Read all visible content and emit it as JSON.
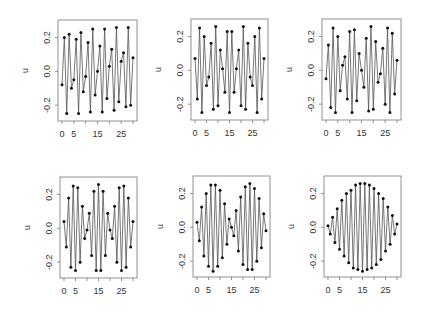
{
  "figure": {
    "layout": "2x3 grid of line plots",
    "background": "#ffffff",
    "line_color": "#555555",
    "point_color": "#111111",
    "axis_color": "#777777"
  },
  "chart_data": [
    {
      "type": "line",
      "title": "",
      "xlabel": "",
      "ylabel": "u",
      "x_ticks": [
        0,
        5,
        15,
        25
      ],
      "y_ticks": [
        "-0.2",
        "0.0",
        "0.2"
      ],
      "ylim": [
        -0.27,
        0.28
      ],
      "xlim": [
        0,
        30
      ],
      "x": [
        0,
        1,
        2,
        3,
        4,
        5,
        6,
        7,
        8,
        9,
        10,
        11,
        12,
        13,
        14,
        15,
        16,
        17,
        18,
        19,
        20,
        21,
        22,
        23,
        24,
        25,
        26,
        27,
        28,
        29,
        30
      ],
      "values": [
        -0.08,
        0.2,
        -0.25,
        0.22,
        -0.1,
        -0.05,
        0.19,
        -0.25,
        0.23,
        -0.12,
        -0.03,
        0.17,
        -0.24,
        0.25,
        -0.14,
        0.0,
        0.15,
        -0.24,
        0.25,
        -0.16,
        0.03,
        0.13,
        -0.23,
        0.26,
        -0.18,
        0.06,
        0.11,
        -0.21,
        0.26,
        -0.2,
        0.08
      ]
    },
    {
      "type": "line",
      "title": "",
      "xlabel": "",
      "ylabel": "u",
      "x_ticks": [
        0,
        5,
        15,
        25
      ],
      "y_ticks": [
        "-0.2",
        "0.0",
        "0.2"
      ],
      "ylim": [
        -0.27,
        0.28
      ],
      "xlim": [
        0,
        30
      ],
      "x": [
        0,
        1,
        2,
        3,
        4,
        5,
        6,
        7,
        8,
        9,
        10,
        11,
        12,
        13,
        14,
        15,
        16,
        17,
        18,
        19,
        20,
        21,
        22,
        23,
        24,
        25,
        26,
        27,
        28,
        29,
        30
      ],
      "values": [
        0.07,
        -0.17,
        0.25,
        -0.25,
        0.2,
        -0.09,
        -0.04,
        0.16,
        -0.23,
        0.26,
        -0.21,
        0.12,
        0.01,
        -0.13,
        0.23,
        -0.25,
        0.23,
        -0.13,
        0.01,
        0.12,
        -0.21,
        0.26,
        -0.23,
        0.16,
        -0.04,
        -0.09,
        0.2,
        -0.25,
        0.25,
        -0.17,
        0.07
      ]
    },
    {
      "type": "line",
      "title": "",
      "xlabel": "",
      "ylabel": "u",
      "x_ticks": [
        0,
        5,
        15,
        25
      ],
      "y_ticks": [
        "-0.2",
        "0.0",
        "0.2"
      ],
      "ylim": [
        -0.27,
        0.28
      ],
      "xlim": [
        0,
        30
      ],
      "x": [
        0,
        1,
        2,
        3,
        4,
        5,
        6,
        7,
        8,
        9,
        10,
        11,
        12,
        13,
        14,
        15,
        16,
        17,
        18,
        19,
        20,
        21,
        22,
        23,
        24,
        25,
        26,
        27,
        28,
        29,
        30
      ],
      "values": [
        -0.05,
        0.15,
        -0.22,
        0.25,
        -0.25,
        0.2,
        -0.12,
        0.03,
        0.08,
        -0.17,
        0.23,
        -0.25,
        0.24,
        -0.18,
        0.1,
        0.0,
        -0.1,
        0.19,
        -0.24,
        0.26,
        -0.23,
        0.17,
        -0.07,
        -0.02,
        0.13,
        -0.2,
        0.25,
        -0.25,
        0.22,
        -0.14,
        0.06
      ]
    },
    {
      "type": "line",
      "title": "",
      "xlabel": "",
      "ylabel": "u",
      "x_ticks": [
        0,
        5,
        15,
        25
      ],
      "y_ticks": [
        "-0.2",
        "0.0",
        "0.2"
      ],
      "ylim": [
        -0.27,
        0.28
      ],
      "xlim": [
        0,
        30
      ],
      "x": [
        0,
        1,
        2,
        3,
        4,
        5,
        6,
        7,
        8,
        9,
        10,
        11,
        12,
        13,
        14,
        15,
        16,
        17,
        18,
        19,
        20,
        21,
        22,
        23,
        24,
        25,
        26,
        27,
        28,
        29,
        30
      ],
      "values": [
        0.04,
        -0.11,
        0.18,
        -0.23,
        0.25,
        -0.25,
        0.24,
        -0.2,
        0.13,
        -0.06,
        -0.01,
        0.09,
        -0.16,
        0.22,
        -0.25,
        0.26,
        -0.25,
        0.22,
        -0.16,
        0.09,
        -0.01,
        -0.06,
        0.13,
        -0.2,
        0.24,
        -0.25,
        0.25,
        -0.23,
        0.18,
        -0.11,
        0.04
      ]
    },
    {
      "type": "line",
      "title": "",
      "xlabel": "",
      "ylabel": "u",
      "x_ticks": [
        0,
        5,
        15,
        25
      ],
      "y_ticks": [
        "-0.2",
        "0.0",
        "0.2"
      ],
      "ylim": [
        -0.27,
        0.28
      ],
      "xlim": [
        0,
        30
      ],
      "x": [
        0,
        1,
        2,
        3,
        4,
        5,
        6,
        7,
        8,
        9,
        10,
        11,
        12,
        13,
        14,
        15,
        16,
        17,
        18,
        19,
        20,
        21,
        22,
        23,
        24,
        25,
        26,
        27,
        28,
        29,
        30
      ],
      "values": [
        0.03,
        -0.08,
        0.12,
        -0.17,
        0.2,
        -0.23,
        0.25,
        -0.26,
        0.25,
        -0.23,
        0.22,
        -0.18,
        0.14,
        -0.1,
        0.05,
        0.0,
        -0.05,
        0.1,
        -0.14,
        0.18,
        -0.22,
        0.24,
        -0.25,
        0.26,
        -0.25,
        0.23,
        -0.2,
        0.17,
        -0.12,
        0.08,
        -0.02
      ]
    },
    {
      "type": "line",
      "title": "",
      "xlabel": "",
      "ylabel": "u",
      "x_ticks": [
        0,
        5,
        15,
        25
      ],
      "y_ticks": [
        "-0.2",
        "0.0",
        "0.2"
      ],
      "ylim": [
        -0.27,
        0.28
      ],
      "xlim": [
        0,
        30
      ],
      "x": [
        0,
        1,
        2,
        3,
        4,
        5,
        6,
        7,
        8,
        9,
        10,
        11,
        12,
        13,
        14,
        15,
        16,
        17,
        18,
        19,
        20,
        21,
        22,
        23,
        24,
        25,
        26,
        27,
        28,
        29,
        30
      ],
      "values": [
        0.01,
        -0.04,
        0.06,
        -0.09,
        0.11,
        -0.13,
        0.16,
        -0.17,
        0.2,
        -0.21,
        0.22,
        -0.24,
        0.25,
        -0.25,
        0.26,
        -0.26,
        0.26,
        -0.25,
        0.25,
        -0.24,
        0.23,
        -0.22,
        0.2,
        -0.19,
        0.17,
        -0.14,
        0.12,
        -0.1,
        0.07,
        -0.04,
        0.02
      ]
    }
  ],
  "panels_geometry": [
    {
      "box": [
        58,
        20,
        137,
        121
      ]
    },
    {
      "box": [
        191,
        19,
        268,
        120
      ]
    },
    {
      "box": [
        322,
        19,
        401,
        120
      ]
    },
    {
      "box": [
        60,
        177,
        137,
        278
      ]
    },
    {
      "box": [
        193,
        176,
        270,
        277
      ]
    },
    {
      "box": [
        324,
        176,
        401,
        277
      ]
    }
  ]
}
